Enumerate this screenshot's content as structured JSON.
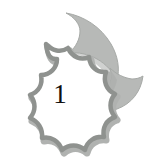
{
  "image": {
    "kind": "clipart-icon",
    "description": "Grayscale crescent moon with scalloped starburst badge",
    "background_color": "#ffffff",
    "width": 159,
    "height": 168
  },
  "moon": {
    "name": "crescent-moon",
    "fill_color": "#b9bbb9",
    "shade_color": "#a9aca9",
    "edge_color": "#9a9d9a"
  },
  "starburst": {
    "name": "scalloped-starburst-badge",
    "fill_color": "#ffffff",
    "outline_color": "#949694",
    "outline_shadow_color": "#a8aaa8",
    "points": 9
  },
  "badge": {
    "number": "1",
    "text_color": "#101010"
  }
}
